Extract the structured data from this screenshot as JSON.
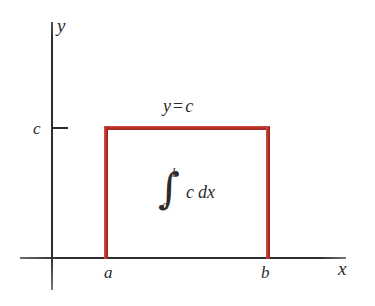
{
  "figure": {
    "axes": {
      "y_axis_label": "y",
      "x_axis_label": "x",
      "y_tick_label": "c",
      "x_tick_labels": [
        "a",
        "b"
      ]
    },
    "annotations": {
      "line_equation_lhs": "y",
      "line_equation_op": "=",
      "line_equation_rhs": "c",
      "integral_sign": "∫",
      "integral_upper_limit": "b",
      "integral_lower_limit": "a",
      "integrand": "c",
      "differential": "dx"
    },
    "colors": {
      "region_stroke": "#bb342c",
      "axis": "#2e2e2e",
      "text": "#2b2b2b",
      "background": "#ffffff"
    }
  },
  "chart_data": {
    "type": "area",
    "xlabel": "x",
    "ylabel": "y",
    "grid": false,
    "legend": null,
    "series": [
      {
        "name": "y = c",
        "x": [
          "a",
          "b"
        ],
        "values": [
          "c",
          "c"
        ]
      }
    ],
    "shaded_region": {
      "from": "a",
      "to": "b",
      "height": "c",
      "label": "∫_a^b c dx"
    },
    "tick_labels": {
      "x": [
        "a",
        "b"
      ],
      "y": [
        "c"
      ]
    }
  }
}
